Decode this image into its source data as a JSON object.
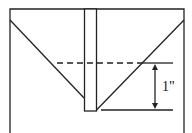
{
  "diagram": {
    "label": "1\"",
    "colors": {
      "stroke": "#222222",
      "background": "#ffffff"
    }
  }
}
